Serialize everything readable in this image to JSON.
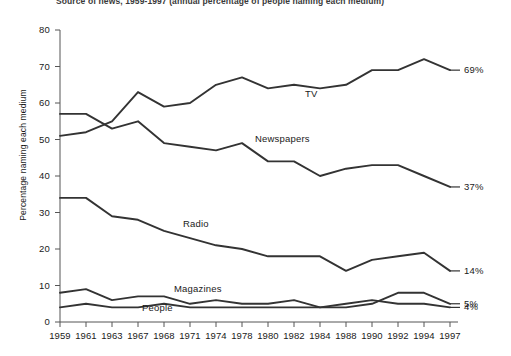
{
  "figure": {
    "title": "Source of news, 1959-1997 (annual percentage of people naming each medium)",
    "ylabel": "Percentage naming each medium"
  },
  "chart_data": {
    "type": "line",
    "title": "Source of news, 1959-1997 (annual percentage of people naming each medium)",
    "xlabel": "",
    "ylabel": "Percentage naming each medium",
    "grid": false,
    "legend": "inline-series-labels",
    "ylim": [
      0,
      80
    ],
    "yticks": [
      0,
      10,
      20,
      30,
      40,
      50,
      60,
      70,
      80
    ],
    "categories": [
      "1959",
      "1961",
      "1963",
      "1967",
      "1968",
      "1971",
      "1974",
      "1978",
      "1980",
      "1982",
      "1984",
      "1988",
      "1990",
      "1992",
      "1994",
      "1997"
    ],
    "series": [
      {
        "name": "TV",
        "label": "TV",
        "end_label": "69%",
        "values": [
          51,
          52,
          55,
          63,
          59,
          60,
          65,
          67,
          64,
          65,
          64,
          65,
          69,
          69,
          72,
          69
        ]
      },
      {
        "name": "Newspapers",
        "label": "Newspapers",
        "end_label": "37%",
        "values": [
          57,
          57,
          53,
          55,
          49,
          48,
          47,
          49,
          44,
          44,
          40,
          42,
          43,
          43,
          40,
          37
        ]
      },
      {
        "name": "Radio",
        "label": "Radio",
        "end_label": "14%",
        "values": [
          34,
          34,
          29,
          28,
          25,
          23,
          21,
          20,
          18,
          18,
          18,
          14,
          17,
          18,
          19,
          14
        ]
      },
      {
        "name": "Magazines",
        "label": "Magazines",
        "end_label": "5%",
        "values": [
          8,
          9,
          6,
          7,
          7,
          5,
          6,
          5,
          5,
          6,
          4,
          4,
          5,
          8,
          8,
          5
        ]
      },
      {
        "name": "People",
        "label": "People",
        "end_label": "4%",
        "values": [
          4,
          5,
          4,
          4,
          5,
          4,
          4,
          4,
          4,
          4,
          4,
          5,
          6,
          5,
          5,
          4
        ]
      }
    ]
  },
  "axis": {
    "yticks": [
      "0",
      "10",
      "20",
      "30",
      "40",
      "50",
      "60",
      "70",
      "80"
    ],
    "xticks": [
      "1959",
      "1961",
      "1963",
      "1967",
      "1968",
      "1971",
      "1974",
      "1978",
      "1980",
      "1982",
      "1984",
      "1988",
      "1990",
      "1992",
      "1994",
      "1997"
    ]
  },
  "style": {
    "line_color": "#333333",
    "axis_color": "#555555",
    "background": "#ffffff"
  }
}
